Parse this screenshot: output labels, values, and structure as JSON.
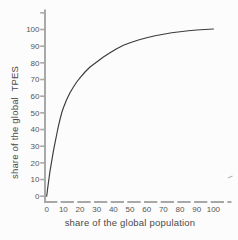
{
  "chart_data": {
    "type": "line",
    "title": "",
    "xlabel": "share of the global population",
    "ylabel": "share of the global  TPES",
    "xlim": [
      0,
      100
    ],
    "ylim": [
      0,
      100
    ],
    "x_ticks": [
      0,
      10,
      20,
      30,
      40,
      50,
      60,
      70,
      80,
      90,
      100
    ],
    "y_ticks": [
      0,
      10,
      20,
      30,
      40,
      50,
      60,
      70,
      80,
      90,
      100
    ],
    "grid": false,
    "legend": false,
    "x_axis_style": "dashed",
    "series": [
      {
        "name": "cumulative share of global TPES by cumulative share of global population",
        "points": [
          [
            0,
            0
          ],
          [
            0.5,
            4
          ],
          [
            1,
            8
          ],
          [
            1.5,
            11.5
          ],
          [
            2,
            15
          ],
          [
            3,
            21
          ],
          [
            4,
            27
          ],
          [
            5,
            32
          ],
          [
            6,
            37
          ],
          [
            7,
            42
          ],
          [
            8,
            46
          ],
          [
            9,
            50
          ],
          [
            10,
            53
          ],
          [
            12,
            58
          ],
          [
            14,
            62
          ],
          [
            16,
            65.5
          ],
          [
            18,
            68.5
          ],
          [
            20,
            71
          ],
          [
            23,
            74.5
          ],
          [
            26,
            77.5
          ],
          [
            30,
            80.5
          ],
          [
            34,
            83.5
          ],
          [
            38,
            86
          ],
          [
            42,
            88.5
          ],
          [
            46,
            90.5
          ],
          [
            50,
            92
          ],
          [
            55,
            93.7
          ],
          [
            60,
            95
          ],
          [
            65,
            96.2
          ],
          [
            70,
            97.2
          ],
          [
            75,
            98
          ],
          [
            80,
            98.7
          ],
          [
            85,
            99.2
          ],
          [
            90,
            99.7
          ],
          [
            95,
            100
          ],
          [
            100,
            100.3
          ]
        ]
      }
    ]
  },
  "colors": {
    "axis": "#a8a8a8",
    "tick_label": "#555555",
    "axis_title": "#4a4a4a",
    "curve": "#3b3b3b",
    "background": "#fcfcfc",
    "artifact": "#b5b5b5"
  }
}
